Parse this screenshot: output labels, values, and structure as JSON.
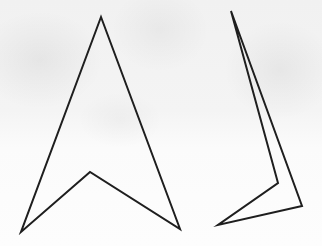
{
  "figure": {
    "background_color": "#f4f4f4",
    "stroke_color": "#1e1e1e",
    "stroke_width": 2,
    "shapes": [
      {
        "name": "arrowhead-front-view",
        "points": "101,17 180,229 90,172 21,232"
      },
      {
        "name": "arrowhead-tilted-view",
        "points": "231,11 302,206 218,225 278,183"
      }
    ]
  }
}
